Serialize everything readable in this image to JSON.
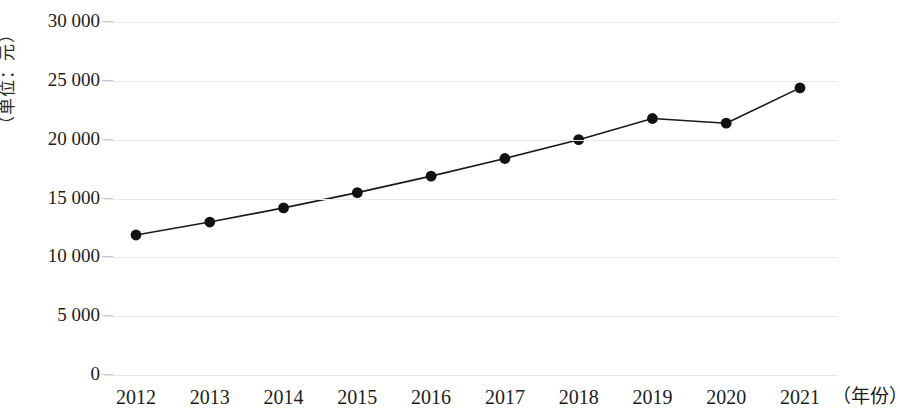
{
  "chart_data": {
    "type": "line",
    "title": "",
    "subtitle": "",
    "xlabel": "年份",
    "ylabel": "单位：元",
    "y_axis_caption": "（单位：元）",
    "x_axis_caption": "（年份）",
    "categories": [
      "2012",
      "2013",
      "2014",
      "2015",
      "2016",
      "2017",
      "2018",
      "2019",
      "2020",
      "2021"
    ],
    "values": [
      11900,
      13000,
      14200,
      15500,
      16900,
      18400,
      20000,
      21800,
      21400,
      24400
    ],
    "series": [
      {
        "name": "",
        "values": [
          11900,
          13000,
          14200,
          15500,
          16900,
          18400,
          20000,
          21800,
          21400,
          24400
        ]
      }
    ],
    "ylim": [
      0,
      30000
    ],
    "ytick_values": [
      0,
      5000,
      10000,
      15000,
      20000,
      25000,
      30000
    ],
    "ytick_labels": [
      "0",
      "5 000",
      "10 000",
      "15 000",
      "20 000",
      "25 000",
      "30 000"
    ],
    "grid": true,
    "grid_axis": "y",
    "legend": false,
    "legend_position": "none",
    "marker": "circle",
    "marker_color": "#111111",
    "line_color": "#1a1a1a",
    "grid_color": "#e9e9e9",
    "background_color": "#ffffff"
  }
}
